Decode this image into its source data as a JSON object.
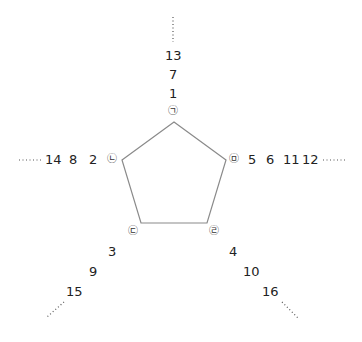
{
  "diagram": {
    "shape": "pentagon",
    "vertices": [
      {
        "id": "top",
        "marker": "㉠"
      },
      {
        "id": "right",
        "marker": "㉤"
      },
      {
        "id": "bottom_right",
        "marker": "㉣"
      },
      {
        "id": "bottom_left",
        "marker": "㉢"
      },
      {
        "id": "left",
        "marker": "㉡"
      }
    ],
    "sequences": {
      "top": [
        "1",
        "7",
        "13"
      ],
      "right": [
        "5",
        "6",
        "11",
        "12"
      ],
      "bottom_right": [
        "4",
        "10",
        "16"
      ],
      "bottom_left": [
        "3",
        "9",
        "15"
      ],
      "left": [
        "2",
        "8",
        "14"
      ]
    },
    "ellipsis": "……"
  }
}
